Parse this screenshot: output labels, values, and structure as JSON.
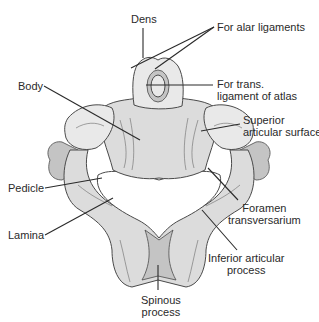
{
  "diagram": {
    "labels": {
      "dens": "Dens",
      "alar": "For alar ligaments",
      "trans_line1": "For trans.",
      "trans_line2": "ligament of atlas",
      "body": "Body",
      "superior_line1": "Superior",
      "superior_line2": "articular surface",
      "pedicle": "Pedicle",
      "foramen_line1": "Foramen",
      "foramen_line2": "transversarium",
      "lamina": "Lamina",
      "inferior_line1": "Inferior articular",
      "inferior_line2": "process",
      "spinous_line1": "Spinous",
      "spinous_line2": "process"
    },
    "colors": {
      "text": "#2a2a2a",
      "bone": "#dcdcdc",
      "outline": "#4a4a4a"
    }
  }
}
